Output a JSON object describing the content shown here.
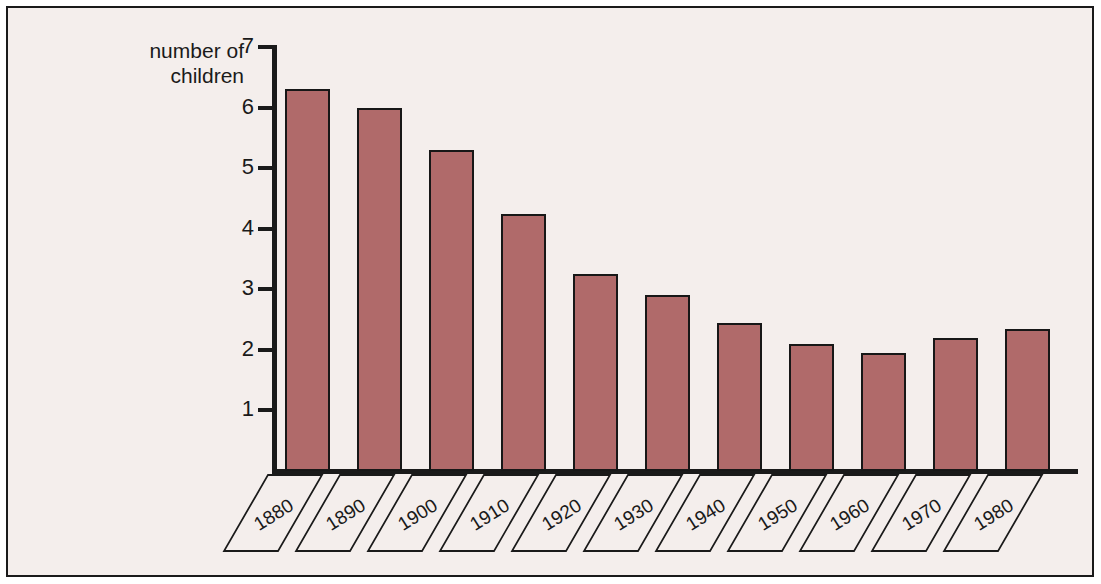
{
  "chart_data": {
    "type": "bar",
    "title": "",
    "subtitle": "",
    "xlabel": "",
    "ylabel": "number of\nchildren",
    "categories": [
      "1880",
      "1890",
      "1900",
      "1910",
      "1920",
      "1930",
      "1940",
      "1950",
      "1960",
      "1970",
      "1980"
    ],
    "values": [
      6.3,
      6.0,
      5.3,
      4.25,
      3.25,
      2.9,
      2.45,
      2.1,
      1.95,
      2.2,
      2.35
    ],
    "ytick_labels": [
      "7",
      "6",
      "5",
      "4",
      "3",
      "2",
      "1"
    ],
    "ytick_values": [
      7,
      6,
      5,
      4,
      3,
      2,
      1
    ],
    "ylim": [
      0,
      7
    ],
    "grid": false,
    "legend": null,
    "legend_position": "none",
    "bar_color": "#b06a6a",
    "bar_edge_color": "#171717",
    "axis_color": "#1a1a1a",
    "background_color": "#f4eeec",
    "frame_color": "#1a1a1a"
  }
}
